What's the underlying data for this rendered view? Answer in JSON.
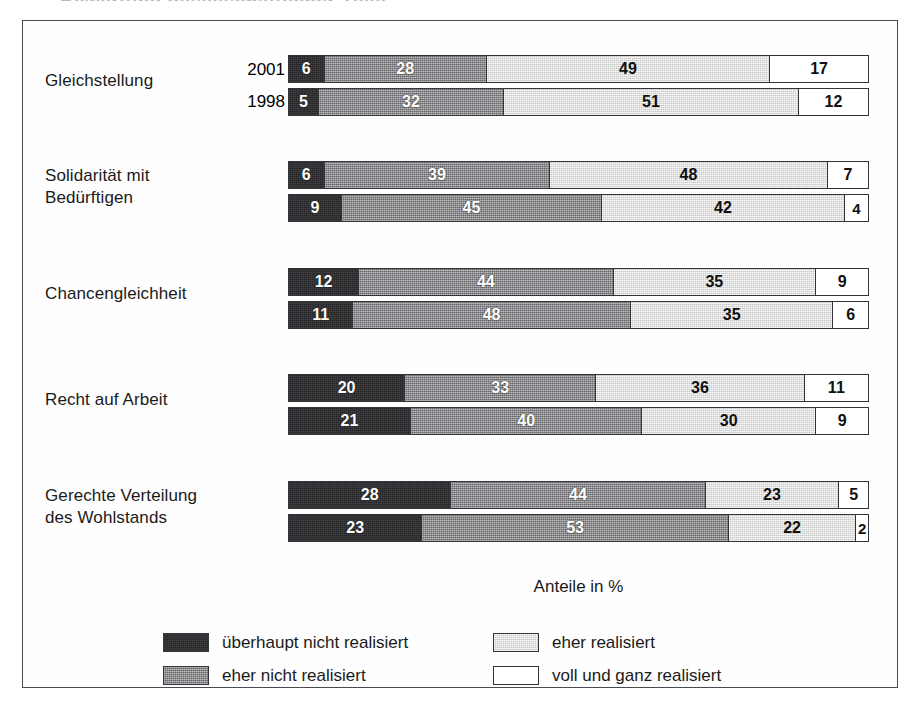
{
  "figure": {
    "axis_caption": "Anteile in %",
    "title_cut_off": "Bewertung gesellschaftlicher Ziele"
  },
  "colors": {
    "ueberhaupt_nicht": "#262629",
    "eher_nicht": "#7c7c80",
    "eher": "#dcdcdc",
    "voll_und_ganz": "#ffffff",
    "frame": "#4a4a52",
    "text": "#1a1a1a"
  },
  "legend": {
    "items": [
      {
        "label": "überhaupt nicht realisiert",
        "swatch": "s0"
      },
      {
        "label": "eher realisiert",
        "swatch": "s2"
      },
      {
        "label": "eher nicht realisiert",
        "swatch": "s1"
      },
      {
        "label": "voll und ganz realisiert",
        "swatch": "s3"
      }
    ]
  },
  "chart_data": {
    "type": "bar",
    "orientation": "horizontal",
    "stacked": true,
    "stack_total": 100,
    "title": "",
    "xlabel": "Anteile in %",
    "ylabel": "",
    "xlim": [
      0,
      100
    ],
    "grid": false,
    "legend_position": "bottom",
    "series": [
      {
        "name": "überhaupt nicht realisiert",
        "key": "s0"
      },
      {
        "name": "eher nicht realisiert",
        "key": "s1"
      },
      {
        "name": "eher realisiert",
        "key": "s2"
      },
      {
        "name": "voll und ganz realisiert",
        "key": "s3"
      }
    ],
    "categories": [
      "Gleichstellung",
      "Solidarität mit Bedürftigen",
      "Chancengleichheit",
      "Recht auf Arbeit",
      "Gerechte Verteilung des Wohlstands"
    ],
    "years": [
      "2001",
      "1998"
    ],
    "groups": [
      {
        "label": "Gleichstellung",
        "label_lines": "Gleichstellung",
        "show_years": true,
        "rows": [
          {
            "year": "2001",
            "values": [
              6,
              28,
              49,
              17
            ]
          },
          {
            "year": "1998",
            "values": [
              5,
              32,
              51,
              12
            ]
          }
        ]
      },
      {
        "label": "Solidarität mit Bedürftigen",
        "label_lines": "Solidarität mit\nBedürftigen",
        "show_years": false,
        "rows": [
          {
            "year": "2001",
            "values": [
              6,
              39,
              48,
              7
            ]
          },
          {
            "year": "1998",
            "values": [
              9,
              45,
              42,
              4
            ]
          }
        ]
      },
      {
        "label": "Chancengleichheit",
        "label_lines": "Chancengleichheit",
        "show_years": false,
        "rows": [
          {
            "year": "2001",
            "values": [
              12,
              44,
              35,
              9
            ]
          },
          {
            "year": "1998",
            "values": [
              11,
              48,
              35,
              6
            ]
          }
        ]
      },
      {
        "label": "Recht auf Arbeit",
        "label_lines": "Recht auf Arbeit",
        "show_years": false,
        "rows": [
          {
            "year": "2001",
            "values": [
              20,
              33,
              36,
              11
            ]
          },
          {
            "year": "1998",
            "values": [
              21,
              40,
              30,
              9
            ]
          }
        ]
      },
      {
        "label": "Gerechte Verteilung des Wohlstands",
        "label_lines": "Gerechte Verteilung\ndes Wohlstands",
        "show_years": false,
        "rows": [
          {
            "year": "2001",
            "values": [
              28,
              44,
              23,
              5
            ]
          },
          {
            "year": "1998",
            "values": [
              23,
              53,
              22,
              2
            ]
          }
        ]
      }
    ]
  }
}
